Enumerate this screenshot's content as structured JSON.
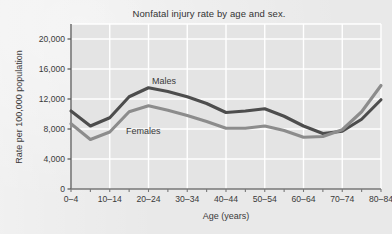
{
  "chart_data": {
    "type": "line",
    "title": "Nonfatal injury rate by age and sex.",
    "xlabel": "Age (years)",
    "ylabel": "Rate per 100,000 population",
    "grid": true,
    "legend_position": "inline-annotation",
    "ylim": [
      0,
      22000
    ],
    "yticks": [
      0,
      4000,
      8000,
      12000,
      16000,
      20000
    ],
    "ytick_labels": [
      "0",
      "4,000",
      "8,000",
      "12,000",
      "16,000",
      "20,000"
    ],
    "categories": [
      "0–4",
      "5–9",
      "10–14",
      "15–19",
      "20–24",
      "25–29",
      "30–34",
      "35–39",
      "40–44",
      "45–49",
      "50–54",
      "55–59",
      "60–64",
      "65–69",
      "70–74",
      "75–79",
      "80–84"
    ],
    "xtick_labels_shown": [
      "0–4",
      "10–14",
      "20–24",
      "30–34",
      "40–44",
      "50–54",
      "60–64",
      "70–74",
      "80–84"
    ],
    "series": [
      {
        "name": "Males",
        "color": "#4d4d4d",
        "label_text": "Males",
        "values": [
          10400,
          8400,
          9500,
          12300,
          13500,
          13000,
          12300,
          11400,
          10200,
          10400,
          10700,
          9700,
          8400,
          7400,
          7700,
          9300,
          11900
        ]
      },
      {
        "name": "Females",
        "color": "#8c8c8c",
        "label_text": "Females",
        "values": [
          8700,
          6600,
          7600,
          10300,
          11100,
          10500,
          9800,
          9000,
          8100,
          8100,
          8400,
          7800,
          6900,
          7000,
          7900,
          10300,
          13800
        ]
      }
    ]
  },
  "colors": {
    "background": "#e9e9e9",
    "plot_background": "#e4e4e4",
    "gridline": "#ffffff",
    "axis": "#555555",
    "text": "#3a3a3a",
    "males": "#4d4d4d",
    "females": "#8c8c8c"
  }
}
